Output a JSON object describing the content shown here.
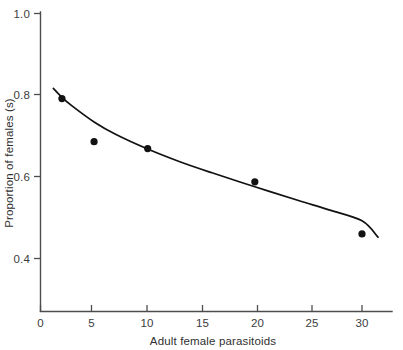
{
  "figure": {
    "background_color": "#ffffff",
    "ink_color": "#111111",
    "axis_color": "#4d4d4d"
  },
  "chart_data": {
    "type": "scatter",
    "title": "",
    "subtitle": "",
    "xlabel": "Adult female parasitoids",
    "ylabel": "Proportion of females (s)",
    "xlim": [
      0,
      33
    ],
    "ylim": [
      0.3,
      1.0
    ],
    "grid": false,
    "legend": false,
    "x_ticks": [
      0,
      5,
      10,
      15,
      20,
      25,
      30
    ],
    "x_tick_labels": [
      "0",
      "5",
      "10",
      "15",
      "20",
      "25",
      "30"
    ],
    "y_ticks": [
      0.4,
      0.6,
      0.8,
      1.0
    ],
    "y_tick_labels": [
      "0.4",
      "0.6",
      "0.8",
      "1.0"
    ],
    "x": [
      2,
      5,
      10,
      20,
      30
    ],
    "y": [
      0.79,
      0.685,
      0.668,
      0.587,
      0.46
    ],
    "points": [
      {
        "x": 2,
        "y": 0.79
      },
      {
        "x": 5,
        "y": 0.685
      },
      {
        "x": 10,
        "y": 0.668
      },
      {
        "x": 20,
        "y": 0.587
      },
      {
        "x": 30,
        "y": 0.46
      }
    ],
    "series": [
      {
        "name": "observed proportion of females",
        "type": "scatter",
        "marker": "filled-circle",
        "color": "#121212",
        "x": [
          2,
          5,
          10,
          20,
          30
        ],
        "values": [
          0.79,
          0.685,
          0.668,
          0.587,
          0.46
        ]
      },
      {
        "name": "fitted curve",
        "type": "line",
        "color": "#111111",
        "x": [
          1.2,
          2,
          3,
          5,
          7,
          10,
          13,
          16,
          20,
          24,
          27,
          30,
          31.5
        ],
        "values": [
          0.815,
          0.793,
          0.771,
          0.733,
          0.703,
          0.667,
          0.636,
          0.609,
          0.575,
          0.542,
          0.518,
          0.492,
          0.452
        ]
      }
    ],
    "annotations": []
  }
}
